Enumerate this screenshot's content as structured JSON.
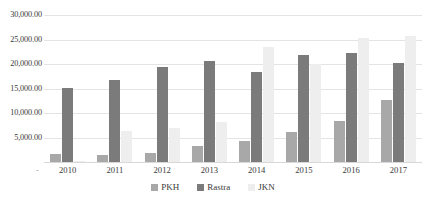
{
  "chart_data": {
    "type": "bar",
    "title": "",
    "subtitle": "",
    "xlabel": "",
    "ylabel": "",
    "categories": [
      "2010",
      "2011",
      "2012",
      "2013",
      "2014",
      "2015",
      "2016",
      "2017"
    ],
    "series": [
      {
        "name": "PKH",
        "color": "#a8a8a8",
        "values": [
          1600,
          1500,
          1800,
          3200,
          4200,
          6100,
          8400,
          12700
        ]
      },
      {
        "name": "Rastra",
        "color": "#7b7b7b",
        "values": [
          15100,
          16700,
          19300,
          20700,
          18400,
          21900,
          22300,
          20200
        ]
      },
      {
        "name": "JKN",
        "color": "#eeeeee",
        "values": [
          150,
          6300,
          7000,
          8200,
          23500,
          20000,
          25300,
          25700
        ]
      }
    ],
    "ylim": [
      0,
      30000
    ],
    "y_ticks": [
      30000,
      25000,
      20000,
      15000,
      10000,
      5000
    ],
    "y_tick_labels": [
      "30,000.00",
      "25,000.00",
      "20,000.00",
      "15,000.00",
      "10,000.00",
      "5,000.00"
    ],
    "y_origin_marker": "-",
    "x_origin_marker": "-",
    "grid": true,
    "grid_axis": "y",
    "legend_position": "bottom-center"
  }
}
